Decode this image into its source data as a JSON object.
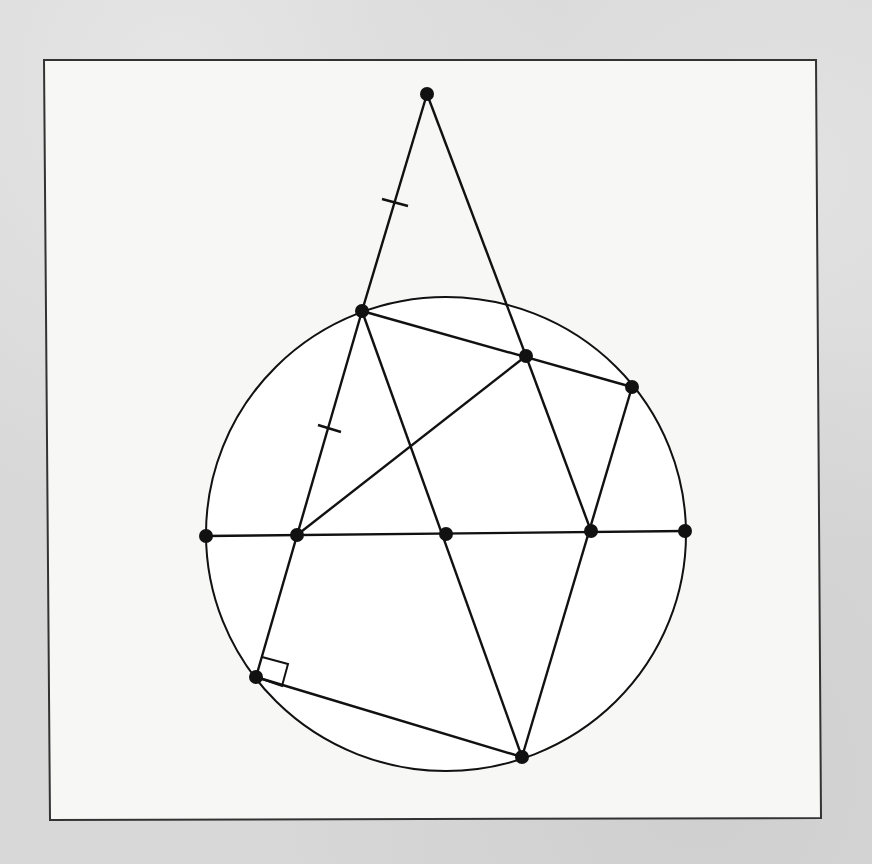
{
  "figure": {
    "frame": {
      "x1": 44,
      "y1": 60,
      "x2": 816,
      "y2": 60,
      "x3": 821,
      "y3": 818,
      "x4": 50,
      "y4": 820
    },
    "colors": {
      "ink": "#111111",
      "paper": "#f7f7f6",
      "background": "#d8d8d8"
    },
    "circle": {
      "cx": 446,
      "cy": 534,
      "rx": 240,
      "ry": 237
    },
    "points": [
      {
        "id": "apex",
        "x": 427,
        "y": 94
      },
      {
        "id": "upper-left",
        "x": 362,
        "y": 311
      },
      {
        "id": "upper-mid",
        "x": 526,
        "y": 356
      },
      {
        "id": "upper-right",
        "x": 632,
        "y": 387
      },
      {
        "id": "diameter-left",
        "x": 206,
        "y": 536
      },
      {
        "id": "mid-left",
        "x": 297,
        "y": 535
      },
      {
        "id": "center",
        "x": 446,
        "y": 534
      },
      {
        "id": "mid-right",
        "x": 591,
        "y": 531
      },
      {
        "id": "diameter-right",
        "x": 685,
        "y": 531
      },
      {
        "id": "lower-left",
        "x": 256,
        "y": 677
      },
      {
        "id": "bottom",
        "x": 522,
        "y": 757
      }
    ],
    "segments": [
      {
        "x1": 427,
        "y1": 94,
        "x2": 362,
        "y2": 311
      },
      {
        "x1": 427,
        "y1": 94,
        "x2": 526,
        "y2": 356
      },
      {
        "x1": 362,
        "y1": 311,
        "x2": 256,
        "y2": 677
      },
      {
        "x1": 362,
        "y1": 311,
        "x2": 632,
        "y2": 387
      },
      {
        "x1": 362,
        "y1": 311,
        "x2": 522,
        "y2": 757
      },
      {
        "x1": 526,
        "y1": 356,
        "x2": 591,
        "y2": 531
      },
      {
        "x1": 526,
        "y1": 356,
        "x2": 297,
        "y2": 535
      },
      {
        "x1": 632,
        "y1": 387,
        "x2": 522,
        "y2": 757
      },
      {
        "x1": 206,
        "y1": 536,
        "x2": 685,
        "y2": 531
      },
      {
        "x1": 256,
        "y1": 677,
        "x2": 522,
        "y2": 757
      }
    ],
    "tick_marks": [
      {
        "x1": 382,
        "y1": 199,
        "x2": 408,
        "y2": 206
      },
      {
        "x1": 318,
        "y1": 425,
        "x2": 341,
        "y2": 432
      }
    ],
    "right_angle_marker": {
      "points": "262,657 288,664 282,686 256,677"
    }
  }
}
